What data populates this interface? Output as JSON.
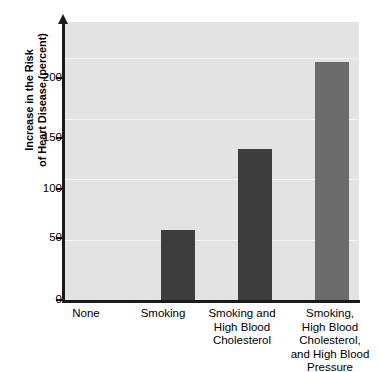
{
  "chart_data": {
    "type": "bar",
    "title": "",
    "xlabel": "",
    "ylabel_line1": "Increase in the Risk",
    "ylabel_line2": "of Heart Disease (percent)",
    "categories": [
      "None",
      "Smoking",
      "Smoking and High Blood Cholesterol",
      "Smoking, High Blood Cholesterol, and High Blood Pressure"
    ],
    "category_label_lines": [
      [
        "None"
      ],
      [
        "Smoking"
      ],
      [
        "Smoking and",
        "High Blood",
        "Cholesterol"
      ],
      [
        "Smoking,",
        "High Blood",
        "Cholesterol,",
        "and High Blood",
        "Pressure"
      ]
    ],
    "values": [
      0,
      58,
      125,
      197
    ],
    "ylim": [
      0,
      230
    ],
    "yticks": [
      0,
      50,
      100,
      150,
      200
    ],
    "ytick_labels": [
      "0",
      "50",
      "100",
      "150",
      "200"
    ],
    "grid": true,
    "legend": "none",
    "bar_colors": [
      "#e3e3e3",
      "#3d3d3d",
      "#3d3d3d",
      "#6b6b6b"
    ],
    "plot_background": "#e3e3e3",
    "gridline_color": "#f4f4f4",
    "axis_color": "#1a1a1a"
  }
}
